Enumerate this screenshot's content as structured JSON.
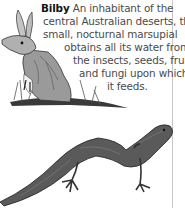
{
  "caption": {
    "title": "Bilby",
    "lines": [
      " An inhabitant of the",
      "central Australian deserts, this",
      "small, nocturnal marsupial",
      "obtains all its water from",
      "the insects, seeds, fruit,",
      "and fungi upon which",
      "it feeds."
    ]
  },
  "illustrations": {
    "top": "bilby-illustration",
    "bottom": "lizard-illustration"
  },
  "colors": {
    "text": "#4a4a4a",
    "title": "#111111",
    "frame_line": "#c8c8c8",
    "ink": "#2a2a2a"
  }
}
